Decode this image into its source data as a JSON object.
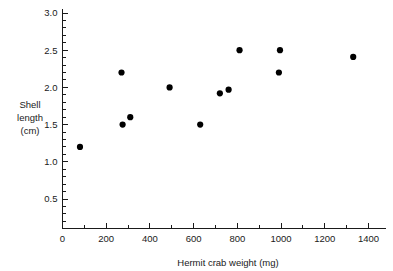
{
  "chart_data": {
    "type": "scatter",
    "title": "",
    "xlabel": "Hermit crab weight (mg)",
    "ylabel": "Shell length (cm)",
    "ylabel_lines": [
      "Shell",
      "length",
      "(cm)"
    ],
    "xlim": [
      0,
      1500
    ],
    "ylim": [
      0,
      3.0
    ],
    "xticks": [
      0,
      200,
      400,
      600,
      800,
      1000,
      1200,
      1400
    ],
    "xtick_labels": [
      "0",
      "200",
      "400",
      "600",
      "800",
      "1000",
      "1200",
      "1400"
    ],
    "x_minor_step": 100,
    "yticks": [
      0.5,
      1.0,
      1.5,
      2.0,
      2.5,
      3.0
    ],
    "ytick_labels": [
      "0.5",
      "1.0",
      "1.5",
      "2.0",
      "2.5",
      "3.0"
    ],
    "y_minor_step": 0.1,
    "grid": false,
    "legend": false,
    "marker": "filled-circle",
    "marker_color": "#000000",
    "points": [
      {
        "x": 80,
        "y": 1.2
      },
      {
        "x": 270,
        "y": 2.2
      },
      {
        "x": 275,
        "y": 1.5
      },
      {
        "x": 310,
        "y": 1.6
      },
      {
        "x": 490,
        "y": 2.0
      },
      {
        "x": 630,
        "y": 1.5
      },
      {
        "x": 720,
        "y": 1.92
      },
      {
        "x": 760,
        "y": 1.97
      },
      {
        "x": 810,
        "y": 2.5
      },
      {
        "x": 990,
        "y": 2.2
      },
      {
        "x": 995,
        "y": 2.5
      },
      {
        "x": 1330,
        "y": 2.41
      }
    ]
  },
  "figure": {
    "background": "#ffffff",
    "axis_color": "#1a1a1a",
    "text_color": "#1a1a1a"
  }
}
